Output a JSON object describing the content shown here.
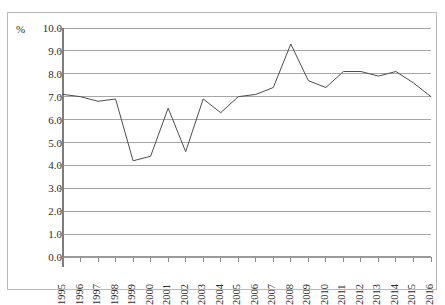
{
  "chart_data": {
    "type": "line",
    "title": "",
    "subtitle": "",
    "xlabel": "",
    "ylabel": "%",
    "unit_label": "%",
    "categories": [
      "1995",
      "1996",
      "1997",
      "1998",
      "1999",
      "2000",
      "2001",
      "2002",
      "2003",
      "2004",
      "2005",
      "2006",
      "2007",
      "2008",
      "2009",
      "2010",
      "2011",
      "2012",
      "2013",
      "2014",
      "2015",
      "2016"
    ],
    "values": [
      7.1,
      7.0,
      6.8,
      6.9,
      4.2,
      4.4,
      6.5,
      4.6,
      6.9,
      6.3,
      7.0,
      7.1,
      7.4,
      9.3,
      7.7,
      7.4,
      8.1,
      8.1,
      7.9,
      8.1,
      7.6,
      7.0
    ],
    "series": [
      {
        "name": "",
        "values": [
          7.1,
          7.0,
          6.8,
          6.9,
          4.2,
          4.4,
          6.5,
          4.6,
          6.9,
          6.3,
          7.0,
          7.1,
          7.4,
          9.3,
          7.7,
          7.4,
          8.1,
          8.1,
          7.9,
          8.1,
          7.6,
          7.0
        ]
      }
    ],
    "ylim": [
      0.0,
      10.0
    ],
    "ytick_step": 1.0,
    "ytick_labels": [
      "10.0",
      "9.0",
      "8.0",
      "7.0",
      "6.0",
      "5.0",
      "4.0",
      "3.0",
      "2.0",
      "1.0",
      "0.0"
    ],
    "ytick_values": [
      10.0,
      9.0,
      8.0,
      7.0,
      6.0,
      5.0,
      4.0,
      3.0,
      2.0,
      1.0,
      0.0
    ],
    "grid": {
      "horizontal": true,
      "vertical": false
    },
    "legend": {
      "visible": false,
      "position": "none",
      "entries": []
    },
    "annotations": [],
    "line_color": "#4d4d4d",
    "grid_color": "#a6a6a6",
    "axis_color": "#7d7d7d",
    "border_color": "#b9b9b9",
    "background_color": "#ffffff",
    "xtick_rotation": -90,
    "markers": false
  }
}
